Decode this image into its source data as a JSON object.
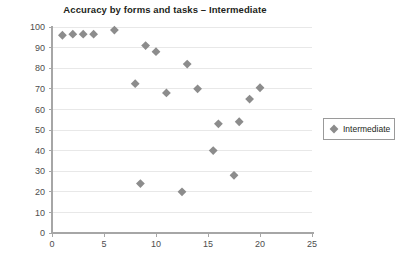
{
  "chart_data": {
    "type": "scatter",
    "title": "Accuracy by forms and tasks – Intermediate",
    "xlabel": "",
    "ylabel": "",
    "xlim": [
      0,
      25
    ],
    "ylim": [
      0,
      100
    ],
    "grid": true,
    "x_ticks": [
      0,
      5,
      10,
      15,
      20,
      25
    ],
    "y_ticks": [
      0,
      10,
      20,
      30,
      40,
      50,
      60,
      70,
      80,
      90,
      100
    ],
    "legend_position": "right",
    "marker": "diamond",
    "marker_color": "#8c8c8c",
    "series": [
      {
        "name": "Intermediate",
        "points": [
          {
            "x": 1,
            "y": 96
          },
          {
            "x": 2,
            "y": 96.5
          },
          {
            "x": 3,
            "y": 96.5
          },
          {
            "x": 4,
            "y": 96.5
          },
          {
            "x": 6,
            "y": 98.5
          },
          {
            "x": 8,
            "y": 72.5
          },
          {
            "x": 8.5,
            "y": 24
          },
          {
            "x": 9,
            "y": 91
          },
          {
            "x": 10,
            "y": 88
          },
          {
            "x": 11,
            "y": 68
          },
          {
            "x": 12.5,
            "y": 20
          },
          {
            "x": 13,
            "y": 82
          },
          {
            "x": 14,
            "y": 70
          },
          {
            "x": 15.5,
            "y": 40
          },
          {
            "x": 16,
            "y": 53
          },
          {
            "x": 17.5,
            "y": 28
          },
          {
            "x": 18,
            "y": 54
          },
          {
            "x": 19,
            "y": 65
          },
          {
            "x": 20,
            "y": 70.5
          }
        ]
      }
    ]
  },
  "legend": {
    "entries": [
      {
        "label": "Intermediate",
        "color": "#8c8c8c",
        "marker": "diamond-icon"
      }
    ]
  },
  "axes": {
    "x_tick_labels": [
      "0",
      "5",
      "10",
      "15",
      "20",
      "25"
    ],
    "y_tick_labels": [
      "0",
      "10",
      "20",
      "30",
      "40",
      "50",
      "60",
      "70",
      "80",
      "90",
      "100"
    ]
  }
}
